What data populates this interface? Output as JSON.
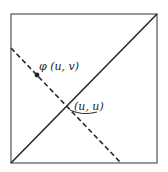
{
  "diagram": {
    "labels": {
      "point_phi": "φ (u, v)",
      "point_diag": "(u, u)"
    },
    "elements": {
      "square": "unit square",
      "diagonal": "solid diagonal",
      "reflection_line": "dashed line"
    },
    "colors": {
      "stroke": "#2a2a2a",
      "background": "#ffffff"
    }
  }
}
